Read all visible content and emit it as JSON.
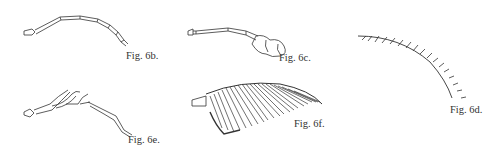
{
  "figures": [
    {
      "id": "6b",
      "caption": "Fig. 6b.",
      "subject": "filiform antenna"
    },
    {
      "id": "6c",
      "caption": "Fig. 6c.",
      "subject": "clavate antenna"
    },
    {
      "id": "6d",
      "caption": "Fig. 6d.",
      "subject": "serrate antenna"
    },
    {
      "id": "6e",
      "caption": "Fig. 6e.",
      "subject": "lamellate/branched antenna"
    },
    {
      "id": "6f",
      "caption": "Fig. 6f.",
      "subject": "pectinate antenna"
    }
  ],
  "colors": {
    "line": "#333333",
    "background": "#ffffff"
  }
}
